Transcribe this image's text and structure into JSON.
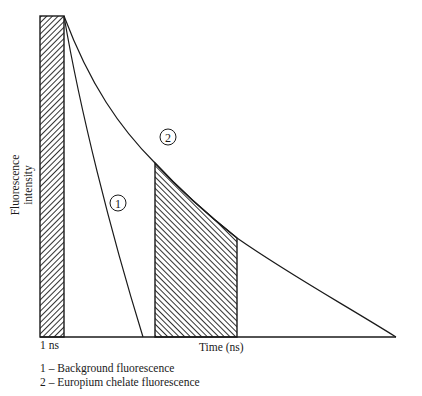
{
  "figure": {
    "y_axis_label_line1": "Fluorescence",
    "y_axis_label_line2": "intensity",
    "x_axis_label": "Time (ns)",
    "pulse_label": "1 ns",
    "curve_markers": [
      {
        "id": "1",
        "label": "1"
      },
      {
        "id": "2",
        "label": "2"
      }
    ],
    "legend": [
      {
        "text": "1 – Background fluorescence"
      },
      {
        "text": "2 – Europium chelate fluorescence"
      }
    ],
    "colors": {
      "line": "#1a1a1a",
      "background": "#ffffff"
    }
  }
}
